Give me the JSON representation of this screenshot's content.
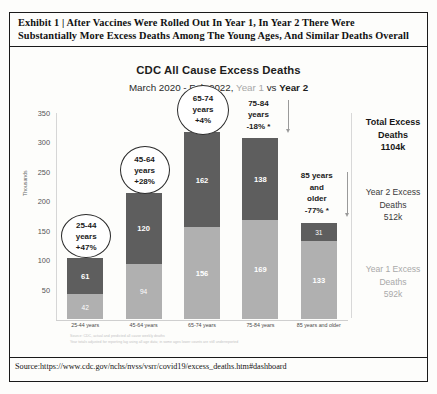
{
  "exhibit": {
    "line1": "Exhibit 1 | After Vaccines Were Rolled Out In Year 1, In Year 2 There Were",
    "line2": "Substantially More Excess Deaths Among The Young Ages, And Similar Deaths Overall"
  },
  "chart": {
    "title": "CDC All Cause Excess Deaths",
    "sub_prefix": "March 2020 - Feb 2022, ",
    "sub_year1": "Year 1",
    "sub_vs": " vs ",
    "sub_year2": "Year 2",
    "ylabel": "Thousands"
  },
  "legend": {
    "total_l1": "Total Excess",
    "total_l2": "Deaths",
    "total_value": "1104k",
    "y2_l1": "Year 2 Excess",
    "y2_l2": "Deaths",
    "y2_value": "512k",
    "y1_l1": "Year 1 Excess",
    "y1_l2": "Deaths",
    "y1_value": "592k"
  },
  "callouts": [
    {
      "age": "25-44",
      "years": "years",
      "pct": "+47%",
      "star": ""
    },
    {
      "age": "45-64",
      "years": "years",
      "pct": "+28%",
      "star": ""
    },
    {
      "age": "65-74",
      "years": "years",
      "pct": "+4%",
      "star": ""
    },
    {
      "age": "75-84",
      "years": "years",
      "pct": "-18%",
      "star": "*"
    },
    {
      "age": "85 years",
      "years": "and",
      "years2": "older",
      "pct": "-77%",
      "star": "*"
    }
  ],
  "footnotes": {
    "line1": "Source: CDC, actual and predicted all cause weekly deaths",
    "line2": "Year totals adjusted for reporting lag using all age data; in some ages lower counts are still underreported"
  },
  "source": "Source:https://www.cdc.gov/nchs/nvss/vsrr/covid19/excess_deaths.htm#dashboard",
  "chart_data": {
    "type": "bar",
    "title": "CDC All Cause Excess Deaths",
    "subtitle": "March 2020 - Feb 2022, Year 1 vs Year 2",
    "xlabel": "",
    "ylabel": "Thousands",
    "ylim": [
      0,
      350
    ],
    "yticks": [
      50,
      100,
      150,
      200,
      250,
      300,
      350
    ],
    "grid": false,
    "stacked": true,
    "legend_position": "right",
    "categories": [
      "25-44 years",
      "45-64 years",
      "65-74 years",
      "75-84 years",
      "85 years and older"
    ],
    "series": [
      {
        "name": "Year 1 Excess Deaths",
        "color": "#b0b0b0",
        "values": [
          42,
          94,
          156,
          169,
          133
        ]
      },
      {
        "name": "Year 2 Excess Deaths",
        "color": "#5e5e5e",
        "values": [
          61,
          120,
          162,
          138,
          31
        ]
      }
    ],
    "totals": [
      103,
      214,
      318,
      307,
      164
    ],
    "annotations": [
      "25-44 years +47%",
      "45-64 years +28%",
      "65-74 years +4%",
      "75-84 years -18% *",
      "85 years and older -77% *"
    ],
    "total_excess_deaths": "1104k",
    "year2_excess_deaths": "512k",
    "year1_excess_deaths": "592k"
  }
}
